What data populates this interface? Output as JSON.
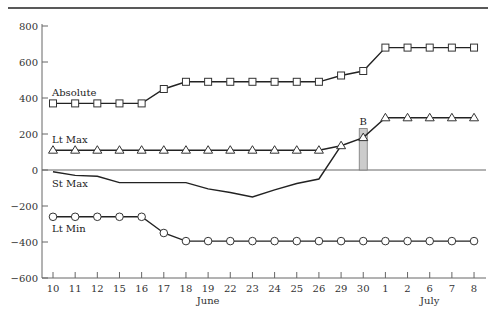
{
  "chart_data": {
    "type": "line",
    "title": "",
    "xlabel": "",
    "ylabel": "",
    "ylim": [
      -600,
      800
    ],
    "yticks": [
      -600,
      -400,
      -200,
      0,
      200,
      400,
      600,
      800
    ],
    "categories": [
      "10",
      "11",
      "12",
      "15",
      "16",
      "17",
      "18",
      "19",
      "22",
      "23",
      "24",
      "25",
      "26",
      "29",
      "30",
      "1",
      "2",
      "6",
      "7",
      "8"
    ],
    "month_labels": [
      {
        "label": "June",
        "at_category": "19"
      },
      {
        "label": "July",
        "at_category": "6"
      }
    ],
    "grid": false,
    "series": [
      {
        "name": "Absolute",
        "marker": "square",
        "values": [
          370,
          370,
          370,
          370,
          370,
          450,
          490,
          490,
          490,
          490,
          490,
          490,
          490,
          525,
          550,
          680,
          680,
          680,
          680,
          680
        ]
      },
      {
        "name": "Lt Max",
        "marker": "triangle",
        "values": [
          110,
          110,
          110,
          110,
          110,
          110,
          110,
          110,
          110,
          110,
          110,
          110,
          110,
          135,
          180,
          290,
          290,
          290,
          290,
          290
        ]
      },
      {
        "name": "St Max",
        "marker": "none",
        "values": [
          -10,
          -30,
          -35,
          -70,
          -70,
          -70,
          -70,
          -105,
          -125,
          -150,
          -110,
          -75,
          -50,
          135,
          null,
          null,
          null,
          null,
          null,
          null
        ]
      },
      {
        "name": "Lt Min",
        "marker": "circle",
        "values": [
          -260,
          -260,
          -260,
          -260,
          -260,
          -350,
          -395,
          -395,
          -395,
          -395,
          -395,
          -395,
          -395,
          -395,
          -395,
          -395,
          -395,
          -395,
          -395,
          -395
        ]
      }
    ],
    "annotations": [
      {
        "label": "B",
        "type": "bar",
        "at_category": "30",
        "from": 0,
        "to": 230,
        "color": "#cccccc"
      }
    ]
  }
}
